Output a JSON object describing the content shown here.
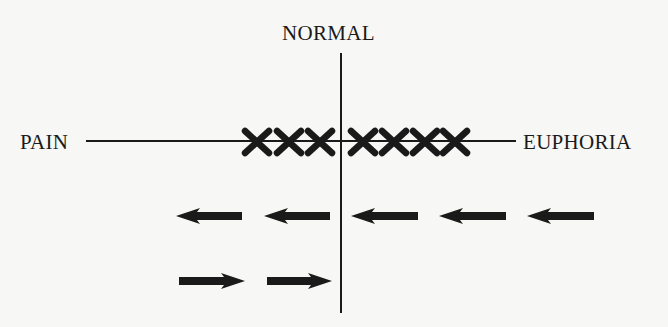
{
  "diagram": {
    "labels": {
      "top": "NORMAL",
      "left": "PAIN",
      "right": "EUPHORIA"
    },
    "axes": {
      "horizontal": {
        "x1": 86,
        "x2": 516,
        "y": 141
      },
      "vertical": {
        "x": 341,
        "y1": 53,
        "y2": 313
      }
    },
    "marks": {
      "symbol": "X",
      "count": 7,
      "left_of_normal": 3,
      "right_of_normal": 4,
      "centers_x": [
        257,
        289,
        320,
        363,
        394,
        425,
        455
      ],
      "center_y": 142
    },
    "arrow_rows": [
      {
        "direction": "left",
        "count": 5,
        "y": 216,
        "spans_x": [
          [
            176,
            242
          ],
          [
            264,
            330
          ],
          [
            351,
            418
          ],
          [
            439,
            506
          ],
          [
            527,
            594
          ]
        ]
      },
      {
        "direction": "right",
        "count": 2,
        "y": 281,
        "spans_x": [
          [
            179,
            245
          ],
          [
            267,
            332
          ]
        ]
      }
    ],
    "colors": {
      "ink": "#1a1a1a",
      "background": "#f7f7f5"
    }
  }
}
